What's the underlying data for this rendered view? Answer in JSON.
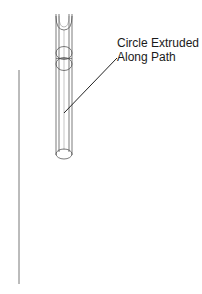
{
  "diagram": {
    "type": "technical-line-drawing",
    "callout": {
      "line1": "Circle Extruded",
      "line2": "Along Path"
    },
    "colors": {
      "background": "#ffffff",
      "stroke": "#333333",
      "text": "#1a1a1a"
    }
  }
}
